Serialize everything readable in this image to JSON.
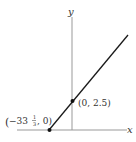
{
  "diagram": {
    "axes": {
      "x_label": "x",
      "y_label": "y"
    },
    "line": {
      "description": "linear function y = 0.075x + 2.5"
    },
    "points": [
      {
        "label_whole": "−33",
        "label_num": "1",
        "label_den": "3",
        "label_rest": ", 0)",
        "label_open": "(",
        "coords": [
          -33.333,
          0
        ]
      },
      {
        "label": "(0, 2.5)",
        "coords": [
          0,
          2.5
        ]
      }
    ],
    "colors": {
      "axis": "#999999",
      "line": "#1a1a1a",
      "text": "#333333"
    }
  }
}
